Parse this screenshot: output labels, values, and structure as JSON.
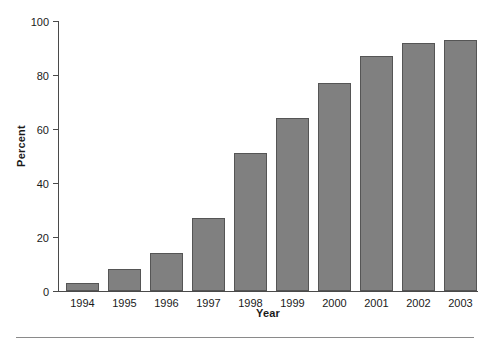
{
  "chart_data": {
    "type": "bar",
    "title": "",
    "xlabel": "Year",
    "ylabel": "Percent",
    "categories": [
      "1994",
      "1995",
      "1996",
      "1997",
      "1998",
      "1999",
      "2000",
      "2001",
      "2002",
      "2003"
    ],
    "values": [
      3,
      8,
      14,
      27,
      51,
      64,
      77,
      87,
      92,
      93
    ],
    "ylim": [
      0,
      100
    ],
    "yticks": [
      0,
      20,
      40,
      60,
      80,
      100
    ],
    "ytick_labels": [
      "0",
      "20",
      "40",
      "60",
      "80",
      "100"
    ],
    "grid": false,
    "legend": false,
    "legend_position": "none",
    "series": [
      {
        "name": "Percent",
        "values": [
          3,
          8,
          14,
          27,
          51,
          64,
          77,
          87,
          92,
          93
        ]
      }
    ],
    "colors": {
      "bar_fill": "#808080",
      "bar_edge": "#555555",
      "axis": "#4a4a4a",
      "text": "#1a1a1a",
      "background": "#ffffff",
      "rule": "#8a8a8a"
    }
  }
}
